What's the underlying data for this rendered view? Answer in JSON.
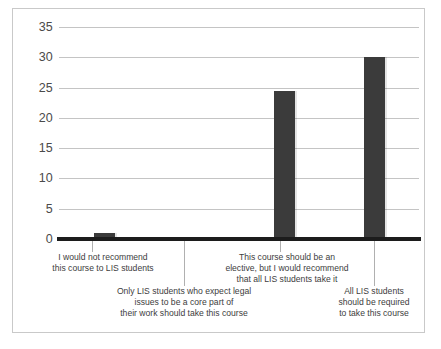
{
  "chart_data": {
    "type": "bar",
    "title": "",
    "subtitle": "",
    "xlabel": "",
    "ylabel": "",
    "ylim": [
      0,
      35
    ],
    "ytick_step": 5,
    "yticks": [
      35,
      30,
      25,
      20,
      15,
      10,
      5,
      0
    ],
    "grid": true,
    "legend": false,
    "legend_position": "none",
    "bar_color": "#3b3b3b",
    "gridline_color": "#c4c4c4",
    "axis_color": "#1c1c1c",
    "categories": [
      "I would not recommend\nthis course to LIS students",
      "Only LIS students who expect legal\nissues to be a core part of\ntheir work should take this course",
      "This course should be an\nelective, but I would recommend\nthat all LIS students take it",
      "All LIS students\nshould be required\nto take this course"
    ],
    "values": [
      1,
      0,
      24.5,
      30
    ]
  },
  "figure": {
    "caption": ""
  }
}
